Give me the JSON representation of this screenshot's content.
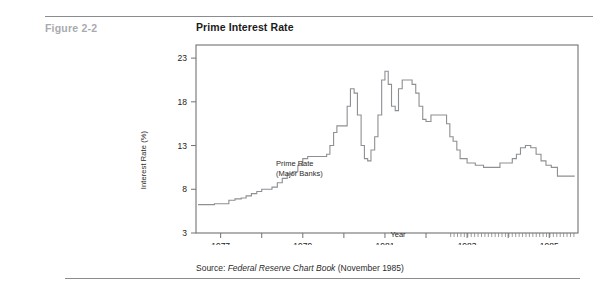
{
  "figure": {
    "label": "Figure 2-2",
    "title": "Prime Interest Rate"
  },
  "source": {
    "prefix": "Source: ",
    "italic_title": "Federal Reserve Chart Book",
    "suffix": " (November 1985)"
  },
  "annotation": {
    "line1": "Prime Rate",
    "line2": "(Major Banks)"
  },
  "colors": {
    "rule": "#8a8d90",
    "figure_label": "#a8abae",
    "title": "#1b1b1b",
    "axis": "#6f7276",
    "line": "#8c8f93",
    "text": "#2a2a2a"
  },
  "chart_data": {
    "type": "line",
    "title": "Prime Interest Rate",
    "xlabel": "Year",
    "ylabel": "Interest Rate (%)",
    "xlim": [
      1976.4,
      1985.7
    ],
    "ylim": [
      3,
      24.5
    ],
    "yticks": [
      3,
      8,
      13,
      18,
      23
    ],
    "ytick_labels": [
      "3",
      "8",
      "13",
      "18",
      "23"
    ],
    "xticks": [
      1977,
      1978,
      1979,
      1980,
      1981,
      1982,
      1983,
      1984,
      1985
    ],
    "xtick_labels_shown": [
      "1977",
      "1979",
      "1981",
      "1983",
      "1985"
    ],
    "xtick_labels_at": [
      1977,
      1979,
      1981,
      1983,
      1985
    ],
    "grid": false,
    "legend": false,
    "series": [
      {
        "name": "Prime Rate (Major Banks)",
        "x": [
          1976.45,
          1976.7,
          1976.85,
          1977.0,
          1977.2,
          1977.35,
          1977.5,
          1977.62,
          1977.75,
          1977.88,
          1978.0,
          1978.12,
          1978.25,
          1978.38,
          1978.5,
          1978.62,
          1978.75,
          1978.88,
          1979.0,
          1979.12,
          1979.25,
          1979.38,
          1979.5,
          1979.58,
          1979.66,
          1979.75,
          1979.83,
          1979.92,
          1980.0,
          1980.08,
          1980.16,
          1980.25,
          1980.33,
          1980.42,
          1980.5,
          1980.58,
          1980.66,
          1980.75,
          1980.83,
          1980.92,
          1981.0,
          1981.08,
          1981.16,
          1981.25,
          1981.33,
          1981.42,
          1981.5,
          1981.58,
          1981.66,
          1981.75,
          1981.83,
          1981.92,
          1982.0,
          1982.12,
          1982.25,
          1982.38,
          1982.5,
          1982.58,
          1982.66,
          1982.75,
          1982.83,
          1982.92,
          1983.0,
          1983.2,
          1983.4,
          1983.6,
          1983.8,
          1984.0,
          1984.1,
          1984.2,
          1984.3,
          1984.42,
          1984.55,
          1984.68,
          1984.8,
          1984.92,
          1985.05,
          1985.2,
          1985.35,
          1985.5,
          1985.62
        ],
        "y": [
          6.25,
          6.25,
          6.35,
          6.35,
          6.75,
          6.9,
          7.0,
          7.25,
          7.5,
          7.75,
          8.0,
          8.0,
          8.25,
          8.75,
          9.25,
          9.75,
          10.0,
          10.75,
          11.5,
          11.75,
          11.75,
          11.75,
          11.75,
          12.0,
          13.0,
          14.5,
          15.25,
          15.25,
          15.25,
          17.5,
          19.5,
          19.0,
          16.5,
          13.0,
          11.5,
          11.25,
          12.5,
          14.0,
          16.5,
          20.5,
          21.5,
          20.0,
          17.5,
          17.0,
          19.5,
          20.5,
          20.5,
          20.5,
          20.0,
          19.0,
          17.5,
          16.0,
          15.75,
          16.5,
          16.5,
          16.5,
          15.5,
          14.0,
          13.5,
          12.5,
          11.5,
          11.5,
          11.0,
          10.75,
          10.5,
          10.5,
          11.0,
          11.0,
          11.5,
          12.0,
          12.75,
          13.0,
          12.75,
          12.0,
          11.25,
          10.75,
          10.5,
          9.5,
          9.5,
          9.5,
          9.5
        ]
      }
    ]
  }
}
